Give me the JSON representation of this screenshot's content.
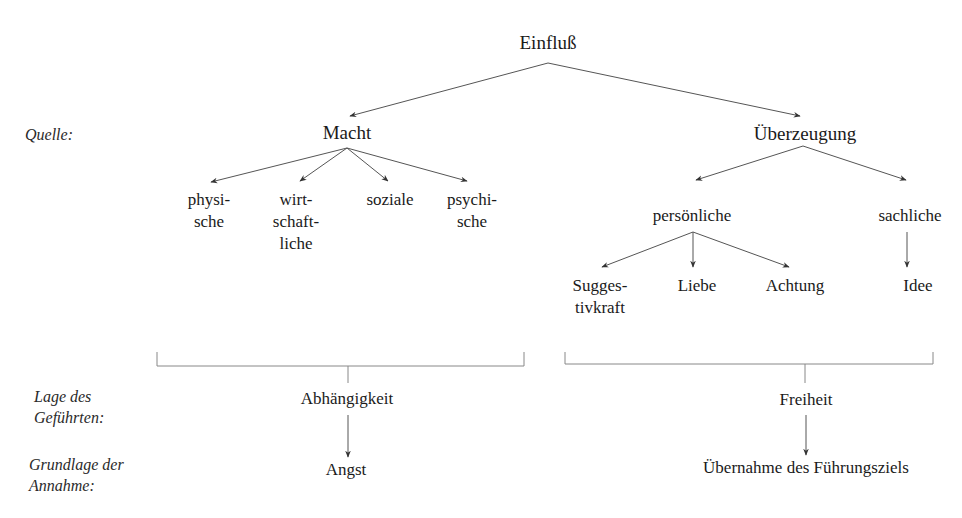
{
  "root": {
    "label": "Einfluß"
  },
  "row_labels": {
    "source": "Quelle:",
    "follower_position": [
      "Lage des",
      "Geführten:"
    ],
    "acceptance_basis": [
      "Grundlage der",
      "Annahme:"
    ]
  },
  "branches": {
    "power": {
      "label": "Macht",
      "children": [
        {
          "lines": [
            "physi-",
            "sche"
          ]
        },
        {
          "lines": [
            "wirt-",
            "schaft-",
            "liche"
          ]
        },
        {
          "lines": [
            "soziale"
          ]
        },
        {
          "lines": [
            "psychi-",
            "sche"
          ]
        }
      ],
      "follower_position": "Abhängigkeit",
      "acceptance_basis": "Angst"
    },
    "conviction": {
      "label": "Überzeugung",
      "personal": {
        "label": "persönliche",
        "children": [
          {
            "lines": [
              "Sugges-",
              "tivkraft"
            ]
          },
          {
            "lines": [
              "Liebe"
            ]
          },
          {
            "lines": [
              "Achtung"
            ]
          }
        ]
      },
      "factual": {
        "label": "sachliche",
        "children": [
          {
            "lines": [
              "Idee"
            ]
          }
        ]
      },
      "follower_position": "Freiheit",
      "acceptance_basis": "Übernahme des Führungsziels"
    }
  },
  "colors": {
    "text": "#1a1a1a",
    "line": "#555555",
    "bracket": "#888888"
  }
}
